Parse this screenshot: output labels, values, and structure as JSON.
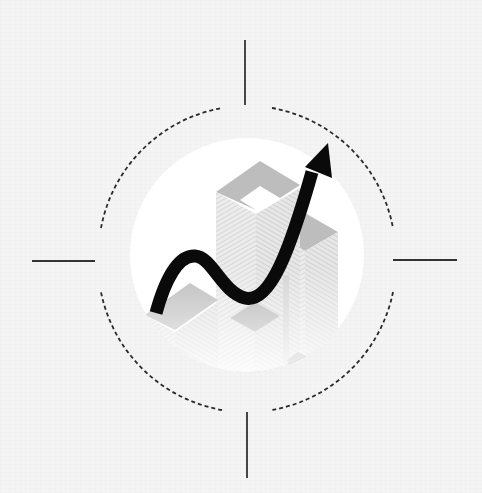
{
  "illustration": {
    "subject": "growth-arrow-over-buildings-in-target-reticle",
    "colors": {
      "background": "#f4f4f4",
      "inner_circle": "#ffffff",
      "reticle": "#2a2a2a",
      "arrow": "#0a0a0a",
      "building_roof": "#bdbdbd",
      "building_wall_light": "#e2e2e2",
      "building_wall_dark": "#cfcfcf"
    },
    "reticle": {
      "center_x": 247,
      "center_y": 260,
      "dashed_radius": 150,
      "ticks": [
        {
          "name": "top",
          "x1": 245,
          "y1": 40,
          "x2": 245,
          "y2": 105
        },
        {
          "name": "bottom",
          "x1": 247,
          "y1": 412,
          "x2": 247,
          "y2": 478
        },
        {
          "name": "left",
          "x1": 32,
          "y1": 261,
          "x2": 95,
          "y2": 261
        },
        {
          "name": "right",
          "x1": 393,
          "y1": 260,
          "x2": 457,
          "y2": 260
        }
      ]
    },
    "inner_circle": {
      "center_x": 247,
      "center_y": 255,
      "radius": 117
    },
    "arrow": {
      "start": [
        155,
        315
      ],
      "tip": [
        328,
        143
      ],
      "direction": "up-right"
    }
  }
}
